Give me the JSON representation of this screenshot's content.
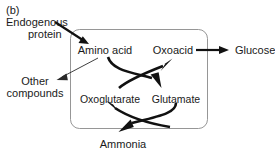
{
  "figure": {
    "panel_label": "(b)",
    "width": 275,
    "height": 153,
    "background_color": "#ffffff",
    "text_color": "#1a1a1a",
    "arrow_color": "#111111",
    "box_stroke_color": "#8a8a8a"
  },
  "diagram_data": {
    "type": "diagram",
    "subtype": "pathway-flow",
    "title": "(b)",
    "compartment": {
      "name": "cycle-box",
      "shape": "rounded-rectangle",
      "label": ""
    },
    "nodes": [
      {
        "id": "endogenous_protein",
        "label_line1": "Endogenous",
        "label_line2": "protein",
        "label": "Endogenous protein",
        "location": "outside-box",
        "position": "top-left"
      },
      {
        "id": "other_compounds",
        "label_line1": "Other",
        "label_line2": "compounds",
        "label": "Other compounds",
        "location": "outside-box",
        "position": "left"
      },
      {
        "id": "amino_acid",
        "label": "Amino acid",
        "location": "inside-box",
        "position": "top-left"
      },
      {
        "id": "oxoacid",
        "label": "Oxoacid",
        "location": "inside-box",
        "position": "top-right"
      },
      {
        "id": "oxoglutarate",
        "label": "Oxoglutarate",
        "location": "inside-box",
        "position": "middle-left"
      },
      {
        "id": "glutamate",
        "label": "Glutamate",
        "location": "inside-box",
        "position": "middle-right"
      },
      {
        "id": "glucose",
        "label": "Glucose",
        "location": "outside-box",
        "position": "right"
      },
      {
        "id": "ammonia",
        "label": "Ammonia",
        "location": "outside-box",
        "position": "bottom"
      }
    ],
    "edges": [
      {
        "id": "protein-to-amino-acid",
        "from": "endogenous_protein",
        "to": "amino_acid",
        "style": "straight",
        "weight": "thick"
      },
      {
        "id": "amino-acid-to-other-compounds",
        "from": "amino_acid",
        "to": "other_compounds",
        "style": "straight",
        "weight": "thin"
      },
      {
        "id": "amino-acid-to-glutamate",
        "from": "amino_acid",
        "to": "glutamate",
        "style": "curved",
        "weight": "thick"
      },
      {
        "id": "oxoglutarate-to-oxoacid",
        "from": "oxoglutarate",
        "to": "oxoacid",
        "style": "curved",
        "weight": "thick"
      },
      {
        "id": "oxoacid-to-glucose",
        "from": "oxoacid",
        "to": "glucose",
        "style": "straight",
        "weight": "thick"
      },
      {
        "id": "glutamate-to-ammonia",
        "from": "glutamate",
        "to": "ammonia",
        "style": "curved",
        "weight": "thick"
      },
      {
        "id": "ammonia-to-oxoglutarate",
        "from": "ammonia",
        "to": "oxoglutarate",
        "style": "curved",
        "weight": "thick"
      }
    ]
  }
}
